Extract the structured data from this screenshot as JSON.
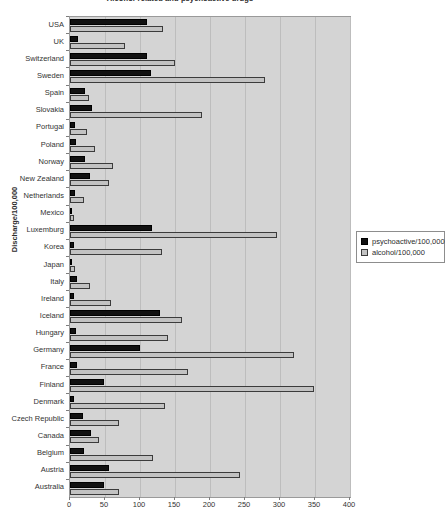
{
  "chart_data": {
    "type": "bar",
    "title": "Alcohol-related and psychoactive drugs",
    "xlabel": "",
    "ylabel": "Discharge/100,000",
    "orientation": "horizontal",
    "grid": true,
    "legend_position": "right",
    "xlim": [
      0,
      400
    ],
    "xticks": [
      0,
      50,
      100,
      150,
      200,
      250,
      300,
      350,
      400
    ],
    "xtick_labels": [
      "0",
      "50",
      "100",
      "150",
      "200",
      "250",
      "300",
      "350",
      "400"
    ],
    "categories": [
      "USA",
      "UK",
      "Switzerland",
      "Sweden",
      "Spain",
      "Slovakia",
      "Portugal",
      "Poland",
      "Norway",
      "New Zealand",
      "Netherlands",
      "Mexico",
      "Luxemburg",
      "Korea",
      "Japan",
      "Italy",
      "Ireland",
      "Iceland",
      "Hungary",
      "Germany",
      "France",
      "Finland",
      "Denmark",
      "Czech Republic",
      "Canada",
      "Belgium",
      "Austria",
      "Australia"
    ],
    "series": [
      {
        "name": "psychoactive/100,000",
        "color": "#111111",
        "values": [
          110,
          12,
          110,
          115,
          22,
          32,
          7,
          8,
          22,
          28,
          7,
          3,
          117,
          5,
          2,
          10,
          5,
          128,
          8,
          100,
          10,
          48,
          5,
          18,
          30,
          20,
          55,
          48
        ]
      },
      {
        "name": "alcohol/100,000",
        "color": "#c2c2c2",
        "values": [
          133,
          78,
          150,
          278,
          27,
          188,
          24,
          35,
          62,
          55,
          20,
          5,
          295,
          132,
          7,
          28,
          58,
          160,
          140,
          320,
          168,
          348,
          135,
          70,
          42,
          118,
          243,
          70
        ]
      }
    ]
  },
  "legend": {
    "items": [
      {
        "label": "psychoactive/100,000",
        "swatch": "psy"
      },
      {
        "label": "alcohol/100,000",
        "swatch": "alc"
      }
    ]
  }
}
